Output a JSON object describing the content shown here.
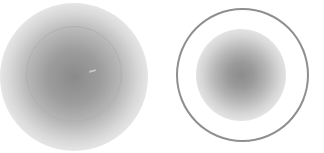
{
  "scene": {
    "description": "Two circular blurred gray spots on white background",
    "objects": [
      {
        "name": "left-blob",
        "style": "soft gray radial gradient with thin light ring",
        "center": [
          74,
          74
        ],
        "ring_radius": 48
      },
      {
        "name": "right-ring",
        "style": "thick gray ring enclosing soft gray radial spot",
        "center": [
          242,
          75
        ],
        "ring_radius": 66
      }
    ],
    "colors": {
      "background": "#ffffff",
      "blob_core": "#8a8a8a",
      "ring_right": "#8f8f8f",
      "ring_left": "#b0b0b0"
    }
  }
}
